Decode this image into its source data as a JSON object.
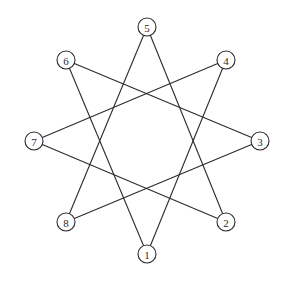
{
  "diagram": {
    "type": "star-polygon-graph",
    "node_radius": 9,
    "colors": {
      "stroke": "#2b2b2b",
      "fill": "#ffffff",
      "background": "#ffffff"
    },
    "nodes": [
      {
        "id": "1",
        "label": "1",
        "x": 147,
        "y": 254
      },
      {
        "id": "2",
        "label": "2",
        "x": 226,
        "y": 222
      },
      {
        "id": "3",
        "label": "3",
        "x": 260,
        "y": 141
      },
      {
        "id": "4",
        "label": "4",
        "x": 226,
        "y": 60
      },
      {
        "id": "5",
        "label": "5",
        "x": 147,
        "y": 27
      },
      {
        "id": "6",
        "label": "6",
        "x": 66,
        "y": 60
      },
      {
        "id": "7",
        "label": "7",
        "x": 34,
        "y": 141
      },
      {
        "id": "8",
        "label": "8",
        "x": 66,
        "y": 222
      }
    ],
    "edges": [
      [
        "1",
        "4"
      ],
      [
        "4",
        "7"
      ],
      [
        "7",
        "2"
      ],
      [
        "2",
        "5"
      ],
      [
        "5",
        "8"
      ],
      [
        "8",
        "3"
      ],
      [
        "3",
        "6"
      ],
      [
        "6",
        "1"
      ]
    ]
  }
}
